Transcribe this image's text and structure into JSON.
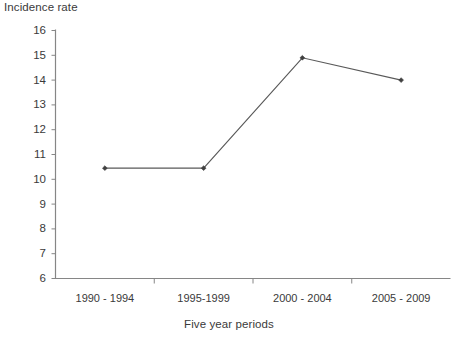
{
  "chart_data": {
    "type": "line",
    "title": "",
    "xlabel": "Five year periods",
    "ylabel": "Incidence rate",
    "categories": [
      "1990 - 1994",
      "1995-1999",
      "2000 - 2004",
      "2005 - 2009"
    ],
    "values": [
      10.45,
      10.45,
      14.9,
      14.0
    ],
    "series": [
      {
        "name": "Incidence rate",
        "values": [
          10.45,
          10.45,
          14.9,
          14.0
        ]
      }
    ],
    "ylim": [
      6,
      16
    ],
    "ytick_labels": [
      "16",
      "15",
      "14",
      "13",
      "12",
      "11",
      "10",
      "9",
      "8",
      "7",
      "6"
    ],
    "ytick_values": [
      16,
      15,
      14,
      13,
      12,
      11,
      10,
      9,
      8,
      7,
      6
    ],
    "grid": false,
    "legend": "none",
    "line_color": "#595959",
    "marker": "diamond",
    "marker_color": "#404040",
    "axis_color": "#868686",
    "background": "#ffffff"
  }
}
